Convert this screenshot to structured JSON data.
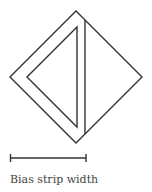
{
  "diagram": {
    "caption": "Bias strip width",
    "stroke_color": "#333333",
    "shapes": {
      "outer_square": {
        "description": "square rotated 45 degrees (diamond)",
        "points": [
          [
            76,
            11
          ],
          [
            142,
            77
          ],
          [
            76,
            143
          ],
          [
            10,
            77
          ]
        ]
      },
      "inner_triangle": {
        "description": "triangle inside left half of diamond",
        "points": [
          [
            77,
            27
          ],
          [
            77,
            127
          ],
          [
            27,
            77
          ]
        ]
      },
      "vertical_line": {
        "description": "vertical fold/cut line",
        "from": [
          85,
          20
        ],
        "to": [
          85,
          134
        ]
      },
      "scale_bar": {
        "description": "dimension bar indicating bias strip width",
        "from": [
          10,
          158
        ],
        "to": [
          86,
          158
        ]
      }
    }
  }
}
